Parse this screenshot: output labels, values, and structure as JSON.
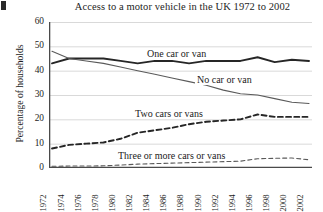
{
  "chart_data": {
    "type": "line",
    "title": "Access to a motor vehicle in the UK 1972 to 2002",
    "xlabel": "",
    "ylabel": "Percentage of households",
    "ylim": [
      0,
      60
    ],
    "xlim": [
      1972,
      2002
    ],
    "grid": true,
    "legend_position": "inline-labels",
    "yticks": [
      0,
      10,
      20,
      30,
      40,
      50,
      60
    ],
    "xticks": [
      1972,
      1974,
      1976,
      1978,
      1980,
      1982,
      1984,
      1986,
      1988,
      1990,
      1992,
      1994,
      1996,
      1998,
      2000,
      2002
    ],
    "minor_xticks_every": 1,
    "x": [
      1972,
      1974,
      1976,
      1978,
      1980,
      1982,
      1984,
      1986,
      1988,
      1990,
      1992,
      1994,
      1996,
      1998,
      2000,
      2002
    ],
    "series": [
      {
        "name": "One car or van",
        "style": "solid-thick",
        "color": "#262626",
        "values": [
          43,
          45,
          45,
          45,
          44,
          43,
          44,
          44,
          43,
          44,
          44,
          44,
          45.5,
          43.5,
          44.5,
          44
        ]
      },
      {
        "name": "No car or van",
        "style": "solid-thin",
        "color": "#5a5a5a",
        "values": [
          48,
          45,
          44,
          43,
          41.5,
          40,
          38.5,
          37,
          35.5,
          34,
          32,
          30.5,
          30,
          28.5,
          27,
          26.5
        ]
      },
      {
        "name": "Two cars or vans",
        "style": "dashed-thick",
        "color": "#262626",
        "values": [
          8,
          9.5,
          10,
          10.5,
          12,
          14.5,
          15.5,
          16.5,
          18,
          19,
          19.5,
          20,
          22,
          21,
          21,
          21
        ]
      },
      {
        "name": "Three or more cars or vans",
        "style": "dashed-thin",
        "color": "#5a5a5a",
        "values": [
          0.7,
          0.8,
          0.8,
          0.9,
          1.2,
          1.6,
          1.8,
          2,
          2.2,
          2.4,
          2.6,
          2.8,
          3.8,
          4,
          4.1,
          3.4
        ]
      }
    ],
    "series_inline_labels": [
      {
        "text": "One car or van",
        "left": 145,
        "top": 48
      },
      {
        "text": "No car or van",
        "left": 195,
        "top": 74
      },
      {
        "text": "Two cars or vans",
        "left": 133,
        "top": 108
      },
      {
        "text": "Three or more cars or vans",
        "left": 116,
        "top": 150
      }
    ]
  }
}
